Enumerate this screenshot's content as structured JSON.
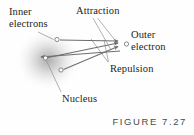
{
  "figure": {
    "caption": "FIGURE 7.27",
    "background_color": "#fefefe",
    "ink_color": "#231f20",
    "arrow_color": "#6e6e6e",
    "leader_color": "#8a8a8a",
    "cloud_color": "#9a9a9a"
  },
  "labels": {
    "inner_electrons": {
      "line1": "Inner",
      "line2": "electrons"
    },
    "attraction": "Attraction",
    "outer_electron": {
      "line1": "Outer",
      "line2": "electron"
    },
    "repulsion": "Repulsion",
    "nucleus": "Nucleus"
  },
  "diagram": {
    "electron_cloud": {
      "center_x": 48,
      "center_y": 60,
      "radius_x": 32,
      "radius_y": 30
    },
    "particles": [
      {
        "name": "nucleus",
        "x": 45,
        "y": 58,
        "r": 2.2
      },
      {
        "name": "inner-electron-upper",
        "x": 57,
        "y": 40,
        "r": 2.2
      },
      {
        "name": "inner-electron-lower",
        "x": 61,
        "y": 70,
        "r": 2.2
      },
      {
        "name": "outer-electron",
        "x": 126,
        "y": 44,
        "r": 2.2
      }
    ],
    "force_arrows": [
      {
        "name": "attraction-nucleus-to-outer",
        "from_x": 47,
        "from_y": 58,
        "to_x": 121,
        "to_y": 44,
        "kind": "attraction"
      },
      {
        "name": "attraction-outer-to-nucleus",
        "from_x": 121,
        "from_y": 51,
        "to_x": 40,
        "to_y": 57,
        "kind": "attraction"
      },
      {
        "name": "repulsion-upper-inner-to-outer",
        "from_x": 60,
        "from_y": 40,
        "to_x": 121,
        "to_y": 42,
        "kind": "repulsion"
      },
      {
        "name": "repulsion-lower-inner-to-outer",
        "from_x": 64,
        "from_y": 70,
        "to_x": 121,
        "to_y": 47,
        "kind": "repulsion"
      }
    ],
    "leader_lines": [
      {
        "name": "leader-inner-electrons",
        "from_x": 38,
        "from_y": 32,
        "to_x": 53,
        "to_y": 40
      },
      {
        "name": "leader-attraction-a",
        "from_x": 93,
        "from_y": 17,
        "to_x": 110,
        "to_y": 49
      },
      {
        "name": "leader-attraction-b",
        "from_x": 97,
        "from_y": 17,
        "to_x": 117,
        "to_y": 44
      },
      {
        "name": "leader-repulsion-a",
        "from_x": 108,
        "from_y": 62,
        "to_x": 92,
        "to_y": 40
      },
      {
        "name": "leader-repulsion-b",
        "from_x": 108,
        "from_y": 62,
        "to_x": 103,
        "to_y": 41
      },
      {
        "name": "leader-nucleus",
        "from_x": 61,
        "from_y": 92,
        "to_x": 46,
        "to_y": 62
      }
    ]
  }
}
